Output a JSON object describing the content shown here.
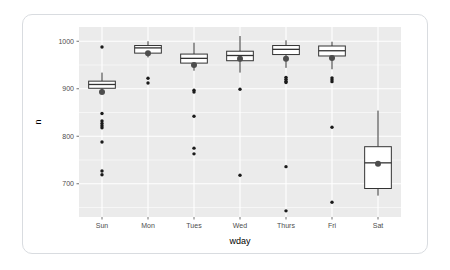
{
  "chart_data": {
    "type": "box",
    "title": "",
    "xlabel": "wday",
    "ylabel": "n",
    "categories": [
      "Sun",
      "Mon",
      "Tues",
      "Wed",
      "Thurs",
      "Fri",
      "Sat"
    ],
    "y_ticks": [
      700,
      800,
      900,
      1000
    ],
    "ylim": [
      630,
      1030
    ],
    "grid": true,
    "legend": "none",
    "panel_background": "#ebebeb",
    "grid_color": "#ffffff",
    "box_fill": "#ffffff",
    "box_stroke": "#333333",
    "mean_point_color": "#4d4d4d",
    "outlier_color": "#1a1a1a",
    "boxes": [
      {
        "category": "Sun",
        "lower_whisker": 893,
        "q1": 901,
        "median": 909,
        "q3": 916,
        "upper_whisker": 934,
        "mean": 893,
        "outliers": [
          988,
          848,
          832,
          827,
          822,
          818,
          788,
          727,
          719
        ]
      },
      {
        "category": "Mon",
        "lower_whisker": 966,
        "q1": 975,
        "median": 986,
        "q3": 991,
        "upper_whisker": 1000,
        "mean": 975,
        "outliers": [
          922,
          912
        ]
      },
      {
        "category": "Tues",
        "lower_whisker": 938,
        "q1": 954,
        "median": 964,
        "q3": 973,
        "upper_whisker": 997,
        "mean": 950,
        "outliers": [
          897,
          893,
          842,
          775,
          763
        ]
      },
      {
        "category": "Wed",
        "lower_whisker": 934,
        "q1": 959,
        "median": 970,
        "q3": 979,
        "upper_whisker": 1011,
        "mean": 963,
        "outliers": [
          899,
          718
        ]
      },
      {
        "category": "Thurs",
        "lower_whisker": 944,
        "q1": 972,
        "median": 983,
        "q3": 991,
        "upper_whisker": 1002,
        "mean": 963,
        "outliers": [
          924,
          920,
          916,
          913,
          736,
          643
        ]
      },
      {
        "category": "Fri",
        "lower_whisker": 941,
        "q1": 969,
        "median": 980,
        "q3": 990,
        "upper_whisker": 999,
        "mean": 965,
        "outliers": [
          923,
          919,
          915,
          819,
          661
        ]
      },
      {
        "category": "Sat",
        "lower_whisker": 675,
        "q1": 690,
        "median": 744,
        "q3": 778,
        "upper_whisker": 854,
        "mean": 742,
        "outliers": []
      }
    ]
  }
}
